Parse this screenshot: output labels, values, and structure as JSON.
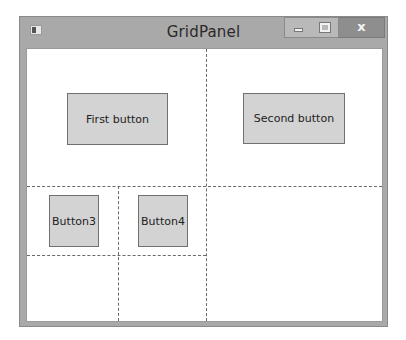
{
  "window": {
    "title": "GridPanel",
    "controls": {
      "minimize": "minimize-button",
      "maximize": "maximize-button",
      "close_glyph": "x"
    }
  },
  "grid": {
    "buttons": [
      {
        "label": "First button"
      },
      {
        "label": "Second button"
      },
      {
        "label": "Button3"
      },
      {
        "label": "Button4"
      }
    ]
  }
}
